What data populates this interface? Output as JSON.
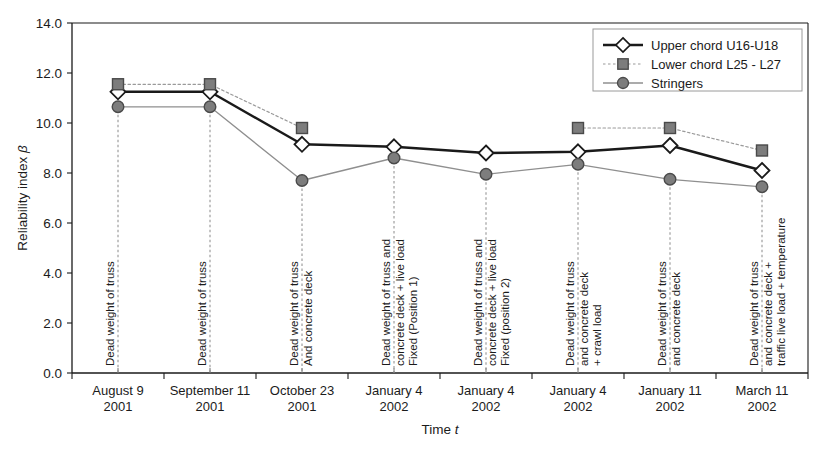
{
  "chart_data": {
    "type": "line",
    "title": "",
    "xlabel": "Time t",
    "ylabel": "Reliability index β",
    "ylim": [
      0.0,
      14.0
    ],
    "ytick_step": 2.0,
    "yticks": [
      "0.0",
      "2.0",
      "4.0",
      "6.0",
      "8.0",
      "10.0",
      "12.0",
      "14.0"
    ],
    "grid": false,
    "legend_position": "top-right",
    "categories": [
      {
        "line1": "August 9",
        "line2": "2001"
      },
      {
        "line1": "September 11",
        "line2": "2001"
      },
      {
        "line1": "October 23",
        "line2": "2001"
      },
      {
        "line1": "January 4",
        "line2": "2002"
      },
      {
        "line1": "January 4",
        "line2": "2002"
      },
      {
        "line1": "January 4",
        "line2": "2002"
      },
      {
        "line1": "January 11",
        "line2": "2002"
      },
      {
        "line1": "March 11",
        "line2": "2002"
      }
    ],
    "series": [
      {
        "name": "Upper chord U16-U18",
        "marker": "diamond",
        "marker_fill": "#ffffff",
        "marker_edge": "#1a1a1a",
        "line_color": "#1a1a1a",
        "line_style": "solid",
        "line_width": 2.4,
        "values": [
          11.25,
          11.25,
          9.15,
          9.05,
          8.8,
          8.85,
          9.1,
          8.1
        ]
      },
      {
        "name": "Lower chord L25 - L27",
        "marker": "square",
        "marker_fill": "#7d7d7d",
        "marker_edge": "#4a4a4a",
        "line_color": "#9a9a9a",
        "line_style": "dotted",
        "line_width": 1.2,
        "values": [
          11.55,
          11.55,
          9.8,
          null,
          null,
          9.8,
          9.8,
          8.9
        ]
      },
      {
        "name": "Stringers",
        "marker": "circle",
        "marker_fill": "#7d7d7d",
        "marker_edge": "#4a4a4a",
        "line_color": "#8f8f8f",
        "line_style": "solid",
        "line_width": 1.3,
        "values": [
          10.65,
          10.65,
          7.7,
          8.6,
          7.95,
          8.35,
          7.75,
          7.45
        ]
      }
    ],
    "annotations": [
      {
        "lines": [
          "Dead weight of truss"
        ]
      },
      {
        "lines": [
          "Dead weight of truss"
        ]
      },
      {
        "lines": [
          "Dead weight of truss",
          "And concrete deck"
        ]
      },
      {
        "lines": [
          "Dead weight of truss and",
          "concrete deck + live load",
          "Fixed (Position 1)"
        ]
      },
      {
        "lines": [
          "Dead weight of truss and",
          "concrete deck + live load",
          "Fixed (position 2)"
        ]
      },
      {
        "lines": [
          "Dead weight of truss",
          "and concrete deck",
          "+ crawl load"
        ]
      },
      {
        "lines": [
          "Dead weight of truss",
          "and concrete deck"
        ]
      },
      {
        "lines": [
          "Dead weight of truss",
          "and concrete deck +",
          "traffic live load + temperature"
        ]
      }
    ],
    "colors": {
      "axis": "#1a1a1a",
      "plot_background": "#ffffff",
      "marker_gray": "#7d7d7d",
      "line_gray": "#8f8f8f",
      "leader_line": "#8a8a8a"
    }
  },
  "legend": {
    "entries": [
      {
        "label": "Upper chord U16-U18"
      },
      {
        "label": "Lower chord L25 - L27"
      },
      {
        "label": "Stringers"
      }
    ]
  }
}
